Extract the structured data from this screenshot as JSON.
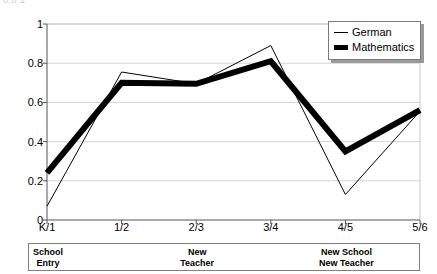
{
  "figure": {
    "clipped_title": "0.0 1",
    "width": 437,
    "height": 274
  },
  "legend": {
    "position": "top-right",
    "entries": [
      {
        "label": "German",
        "style": "thin-line",
        "color": "#000000"
      },
      {
        "label": "Mathematics",
        "style": "thick-line",
        "color": "#000000"
      }
    ]
  },
  "axis": {
    "y_ticks": [
      "1",
      "0.8",
      "0.6",
      "0.4",
      "0.2",
      "0"
    ],
    "x_ticks": [
      "K/1",
      "1/2",
      "2/3",
      "3/4",
      "4/5",
      "5/6"
    ]
  },
  "annotation_band": {
    "cells": [
      {
        "text": "School\nEntry",
        "at_category": "K/1"
      },
      {
        "text": "New\nTeacher",
        "at_category": "2/3"
      },
      {
        "text": "New School\nNew Teacher",
        "at_category": "4/5"
      }
    ]
  },
  "chart_data": {
    "type": "line",
    "title": "",
    "xlabel": "",
    "ylabel": "",
    "categories": [
      "K/1",
      "1/2",
      "2/3",
      "3/4",
      "4/5",
      "5/6"
    ],
    "ylim": [
      0,
      1
    ],
    "ytick_values": [
      0,
      0.2,
      0.4,
      0.6,
      0.8,
      1
    ],
    "grid": "horizontal",
    "legend_position": "top-right",
    "series": [
      {
        "name": "German",
        "values": [
          0.07,
          0.755,
          0.695,
          0.89,
          0.13,
          0.555
        ],
        "color": "#000000",
        "line_width": 1
      },
      {
        "name": "Mathematics",
        "values": [
          0.24,
          0.7,
          0.695,
          0.81,
          0.35,
          0.56
        ],
        "color": "#000000",
        "line_width": 6
      }
    ]
  }
}
